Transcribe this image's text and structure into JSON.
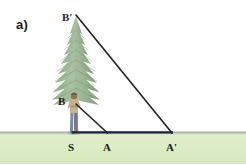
{
  "figure": {
    "panel_label": "a)",
    "background_color": "#ffffff",
    "width": 246,
    "height": 164
  },
  "ground": {
    "band_color": "#dcecc4",
    "edge_color": "#9aa39a",
    "top_y": 133,
    "bottom_y": 164
  },
  "tree": {
    "name": "conifer-tree",
    "foliage_color": "#9bb894",
    "foliage_color_dark": "#7d9c78",
    "trunk_color": "#a78a62",
    "apex_x": 76,
    "apex_y": 15,
    "base_y": 133
  },
  "person": {
    "name": "observer",
    "top_color": "#c6b48d",
    "legs_color": "#7f8aa0",
    "head_color": "#8a7356",
    "eye_level_y": 104
  },
  "points": [
    {
      "id": "Bprime",
      "label": "B'",
      "x": 76,
      "y": 15,
      "role": "tree-top"
    },
    {
      "id": "B",
      "label": "B",
      "x": 76,
      "y": 104,
      "role": "eye-level"
    },
    {
      "id": "S",
      "label": "S",
      "x": 73,
      "y": 133,
      "role": "tree-base"
    },
    {
      "id": "A",
      "label": "A",
      "x": 107,
      "y": 133,
      "role": "near-sight-point"
    },
    {
      "id": "Aprime",
      "label": "A'",
      "x": 172,
      "y": 133,
      "role": "far-sight-point"
    }
  ],
  "lines": [
    {
      "id": "hypotenuse-large",
      "from": "Bprime",
      "to": "Aprime",
      "color": "#231f20",
      "width": 1.6
    },
    {
      "id": "hypotenuse-small",
      "from": "B",
      "to": "A",
      "color": "#231f20",
      "width": 1.6
    },
    {
      "id": "baseline",
      "from": "S",
      "to": "Aprime",
      "color": "#1b2740",
      "width": 2.2
    },
    {
      "id": "vertical-tree-axis",
      "from": "Bprime",
      "to": "S",
      "color": "#8f7a55",
      "width": 1.2
    }
  ],
  "labels": {
    "panel": "a)",
    "Bprime": "B'",
    "B": "B",
    "S": "S",
    "A": "A",
    "Aprime": "A'"
  }
}
